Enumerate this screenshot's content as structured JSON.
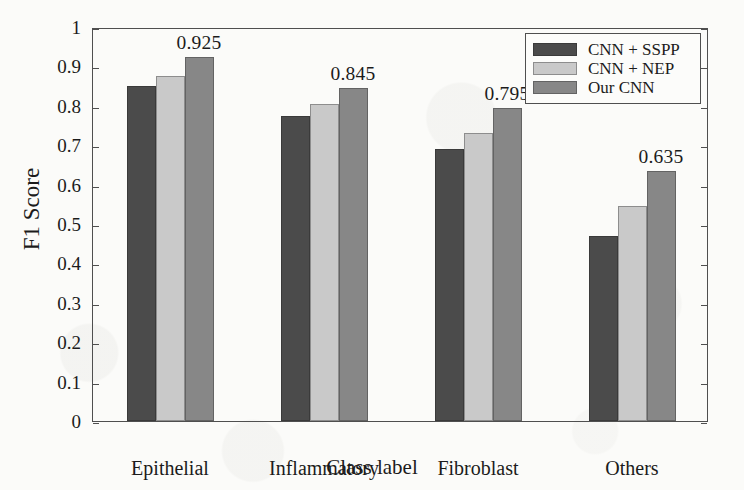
{
  "chart_data": {
    "type": "bar",
    "title": "",
    "xlabel": "Class label",
    "ylabel": "F1 Score",
    "categories": [
      "Epithelial",
      "Inflammatory",
      "Fibroblast",
      "Others"
    ],
    "series": [
      {
        "name": "CNN + SSPP",
        "color": "#4b4b4b",
        "values": [
          0.85,
          0.775,
          0.69,
          0.47
        ]
      },
      {
        "name": "CNN + NEP",
        "color": "#c9c9c9",
        "values": [
          0.875,
          0.805,
          0.73,
          0.545
        ]
      },
      {
        "name": "Our CNN",
        "color": "#878787",
        "values": [
          0.925,
          0.845,
          0.795,
          0.635
        ]
      }
    ],
    "ylim": [
      0,
      1
    ],
    "ytick_labels": [
      "0",
      "0.1",
      "0.2",
      "0.3",
      "0.4",
      "0.5",
      "0.6",
      "0.7",
      "0.8",
      "0.9",
      "1"
    ],
    "ytick_values": [
      0,
      0.1,
      0.2,
      0.3,
      0.4,
      0.5,
      0.6,
      0.7,
      0.8,
      0.9,
      1
    ],
    "grid": false,
    "legend_position": "top-right",
    "annotations": [
      {
        "category": "Epithelial",
        "series": "Our CNN",
        "label": "0.925"
      },
      {
        "category": "Inflammatory",
        "series": "Our CNN",
        "label": "0.845"
      },
      {
        "category": "Fibroblast",
        "series": "Our CNN",
        "label": "0.795"
      },
      {
        "category": "Others",
        "series": "Our CNN",
        "label": "0.635"
      }
    ]
  },
  "legend": {
    "items": [
      {
        "label": "CNN + SSPP"
      },
      {
        "label": "CNN + NEP"
      },
      {
        "label": "Our CNN"
      }
    ]
  },
  "axes": {
    "x_title": "Class label",
    "y_title": "F1 Score"
  }
}
